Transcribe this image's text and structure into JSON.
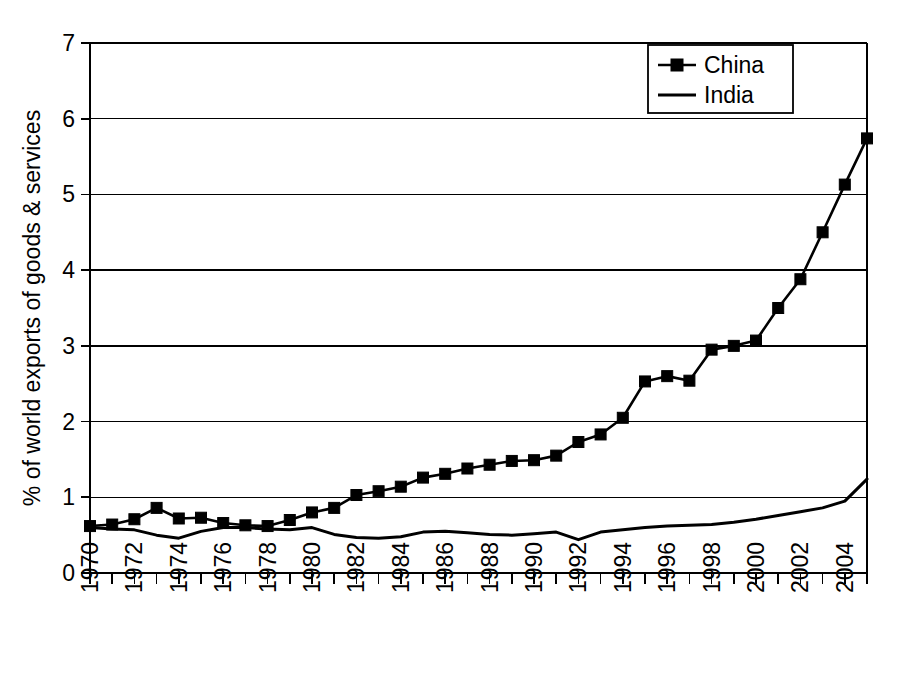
{
  "chart_data": {
    "type": "line",
    "title": "",
    "xlabel": "",
    "ylabel": "% of world exports of goods & services",
    "xlim": [
      1970,
      2005
    ],
    "ylim": [
      0,
      7
    ],
    "y_ticks": [
      "0",
      "1",
      "2",
      "3",
      "4",
      "5",
      "6",
      "7"
    ],
    "x_ticks": [
      "1970",
      "1972",
      "1974",
      "1976",
      "1978",
      "1980",
      "1982",
      "1984",
      "1986",
      "1988",
      "1990",
      "1992",
      "1994",
      "1996",
      "1998",
      "2000",
      "2002",
      "2004"
    ],
    "x_tick_values": [
      1970,
      1972,
      1974,
      1976,
      1978,
      1980,
      1982,
      1984,
      1986,
      1988,
      1990,
      1992,
      1994,
      1996,
      1998,
      2000,
      2002,
      2004
    ],
    "x_minor_values": [
      1970,
      1971,
      1972,
      1973,
      1974,
      1975,
      1976,
      1977,
      1978,
      1979,
      1980,
      1981,
      1982,
      1983,
      1984,
      1985,
      1986,
      1987,
      1988,
      1989,
      1990,
      1991,
      1992,
      1993,
      1994,
      1995,
      1996,
      1997,
      1998,
      1999,
      2000,
      2001,
      2002,
      2003,
      2004,
      2005
    ],
    "grid": "horizontal",
    "legend_position": "top-right",
    "x": [
      1970,
      1971,
      1972,
      1973,
      1974,
      1975,
      1976,
      1977,
      1978,
      1979,
      1980,
      1981,
      1982,
      1983,
      1984,
      1985,
      1986,
      1987,
      1988,
      1989,
      1990,
      1991,
      1992,
      1993,
      1994,
      1995,
      1996,
      1997,
      1998,
      1999,
      2000,
      2001,
      2002,
      2003,
      2004,
      2005
    ],
    "series": [
      {
        "name": "China",
        "marker": "square",
        "color": "#000000",
        "values": [
          0.62,
          0.64,
          0.71,
          0.86,
          0.72,
          0.73,
          0.66,
          0.63,
          0.62,
          0.7,
          0.8,
          0.86,
          1.03,
          1.08,
          1.14,
          1.26,
          1.31,
          1.38,
          1.43,
          1.48,
          1.49,
          1.55,
          1.73,
          1.83,
          2.05,
          2.53,
          2.6,
          2.54,
          2.95,
          3.0,
          3.07,
          3.5,
          3.88,
          4.5,
          5.13,
          5.74
        ]
      },
      {
        "name": "India",
        "marker": "none",
        "color": "#000000",
        "values": [
          0.6,
          0.58,
          0.57,
          0.5,
          0.46,
          0.55,
          0.6,
          0.6,
          0.58,
          0.57,
          0.6,
          0.51,
          0.47,
          0.46,
          0.48,
          0.54,
          0.55,
          0.53,
          0.51,
          0.5,
          0.52,
          0.54,
          0.44,
          0.54,
          0.57,
          0.6,
          0.62,
          0.63,
          0.64,
          0.67,
          0.71,
          0.76,
          0.81,
          0.86,
          0.95,
          1.24
        ]
      }
    ],
    "china_final_value": 6.42,
    "china_2005_value": 6.42,
    "india_2005_value": 1.24
  },
  "legend": {
    "entries": [
      {
        "label": "China",
        "marker": "square"
      },
      {
        "label": "India",
        "marker": "line"
      }
    ]
  },
  "axis": {
    "y_title": "% of world exports of goods & services"
  }
}
